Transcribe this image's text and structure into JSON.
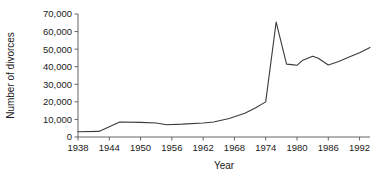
{
  "chart_data": {
    "type": "line",
    "title": "",
    "xlabel": "Year",
    "ylabel": "Number of divorces",
    "xlim": [
      1938,
      1994
    ],
    "ylim": [
      0,
      70000
    ],
    "grid": false,
    "legend": "none",
    "xticks": [
      1938,
      1944,
      1950,
      1956,
      1962,
      1968,
      1974,
      1980,
      1986,
      1992
    ],
    "xtick_labels": [
      "1938",
      "1944",
      "1950",
      "1956",
      "1962",
      "1968",
      "1974",
      "1980",
      "1986",
      "1992"
    ],
    "yticks": [
      0,
      10000,
      20000,
      30000,
      40000,
      50000,
      60000,
      70000
    ],
    "ytick_labels": [
      "0",
      "10,000",
      "20,000",
      "30,000",
      "40,000",
      "50,000",
      "60,000",
      "70,000"
    ],
    "line_color": "#3b3b3b",
    "series": [
      {
        "name": "Number of divorces",
        "x": [
          1938,
          1942,
          1946,
          1950,
          1953,
          1955,
          1958,
          1962,
          1964,
          1967,
          1970,
          1972,
          1974,
          1976,
          1978,
          1979,
          1980,
          1981,
          1983,
          1984,
          1986,
          1988,
          1990,
          1992,
          1994
        ],
        "values": [
          3000,
          3200,
          8500,
          8300,
          8000,
          7000,
          7300,
          8000,
          8500,
          10500,
          13500,
          16500,
          20000,
          65400,
          41500,
          41200,
          40800,
          43500,
          46000,
          45000,
          41000,
          43000,
          45500,
          48000,
          51000
        ]
      }
    ]
  }
}
